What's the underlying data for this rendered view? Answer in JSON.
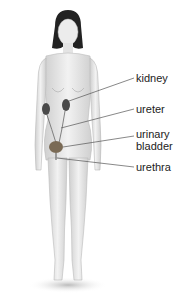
{
  "diagram": {
    "labels": [
      {
        "id": "kidney",
        "text": "kidney",
        "x": 136,
        "y": 74
      },
      {
        "id": "ureter",
        "text": "ureter",
        "x": 136,
        "y": 105
      },
      {
        "id": "urinary-bladder",
        "text": "urinary\nbladder",
        "line1": "urinary",
        "line2": "bladder",
        "x": 136,
        "y": 130
      },
      {
        "id": "urethra",
        "text": "urethra",
        "x": 136,
        "y": 163
      }
    ],
    "colors": {
      "kidney": "#4a4a4a",
      "bladder": "#7a6a55",
      "skin": "#e6e6e6",
      "hair": "#1f1f1f",
      "leader": "#555555"
    }
  }
}
